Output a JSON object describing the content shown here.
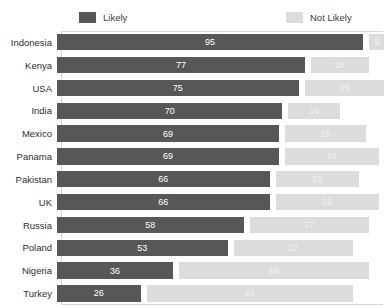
{
  "chart_data": {
    "type": "bar",
    "orientation": "horizontal",
    "stacked": false,
    "grouped": true,
    "title": "",
    "subtitle": "",
    "xlabel": "",
    "ylabel": "",
    "xlim": [
      0,
      100
    ],
    "grid": false,
    "legend_position": "top",
    "legend": [
      "Likely",
      "Not Likely"
    ],
    "categories": [
      "Indonesia",
      "Kenya",
      "USA",
      "India",
      "Mexico",
      "Panama",
      "Pakistan",
      "UK",
      "Russia",
      "Poland",
      "Nigeria",
      "Turkey"
    ],
    "series": [
      {
        "name": "Likely",
        "color": "#575757",
        "values": [
          95,
          77,
          75,
          70,
          69,
          69,
          66,
          66,
          58,
          53,
          36,
          26
        ]
      },
      {
        "name": "Not Likely",
        "color": "#dcdcdc",
        "values": [
          5,
          18,
          25,
          16,
          25,
          29,
          26,
          32,
          37,
          37,
          59,
          64
        ]
      }
    ]
  },
  "legend": {
    "likely_label": "Likely",
    "not_likely_label": "Not Likely"
  },
  "colors": {
    "likely": "#575757",
    "not_likely": "#dcdcdc",
    "background": "#ffffff",
    "frame": "#d8d8d8",
    "label_text": "#2e2e2e"
  }
}
